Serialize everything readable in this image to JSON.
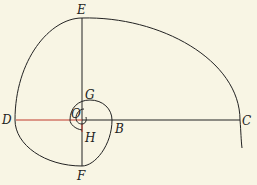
{
  "diagram": {
    "type": "spiral",
    "colors": {
      "background": "#f8f5e4",
      "stroke": "#222222",
      "accent": "#c0392b"
    },
    "labels": {
      "E": "E",
      "G": "G",
      "O": "O",
      "D": "D",
      "B": "B",
      "C": "C",
      "H": "H",
      "F": "F"
    }
  }
}
